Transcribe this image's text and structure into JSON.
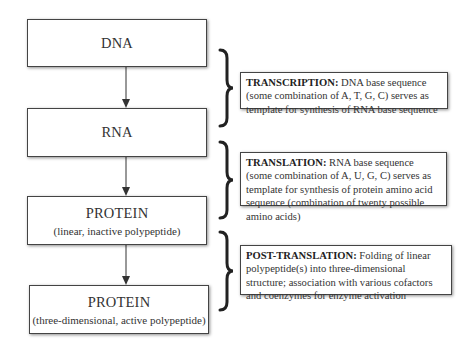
{
  "boxes": [
    {
      "title": "DNA",
      "subtitle": ""
    },
    {
      "title": "RNA",
      "subtitle": ""
    },
    {
      "title": "PROTEIN",
      "subtitle": "(linear, inactive polypeptide)"
    },
    {
      "title": "PROTEIN",
      "subtitle": "(three-dimensional, active polypeptide)"
    }
  ],
  "processes": [
    {
      "label": "TRANSCRIPTION:",
      "text": " DNA base sequence (some combination of A, T, G, C) serves as template for synthesis of RNA base sequence"
    },
    {
      "label": "TRANSLATION:",
      "text": " RNA base sequence (some combination of A, U, G, C) serves as template for synthesis of protein amino acid sequence (combination of twenty possible amino acids)"
    },
    {
      "label": "POST-TRANSLATION:",
      "text": " Folding of linear polypeptide(s) into three-dimensional structure; association with various cofactors and coenzymes for enzyme activation"
    }
  ],
  "colors": {
    "stroke": "#444444",
    "text": "#333333",
    "background": "#ffffff"
  }
}
